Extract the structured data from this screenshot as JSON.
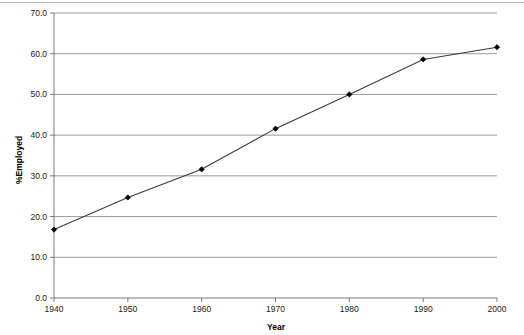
{
  "chart_data": {
    "type": "line",
    "title": "",
    "xlabel": "Year",
    "ylabel": "%Employed",
    "x": [
      1940,
      1950,
      1960,
      1970,
      1980,
      1990,
      2000
    ],
    "values": [
      16.8,
      24.7,
      31.6,
      41.6,
      50.0,
      58.6,
      61.6
    ],
    "series": [
      {
        "name": "%Employed",
        "values": [
          16.8,
          24.7,
          31.6,
          41.6,
          50.0,
          58.6,
          61.6
        ]
      }
    ],
    "xlim": [
      1940,
      2000
    ],
    "ylim": [
      0.0,
      70.0
    ],
    "xticks": [
      "1940",
      "1950",
      "1960",
      "1970",
      "1980",
      "1990",
      "2000"
    ],
    "yticks": [
      "0.0",
      "10.0",
      "20.0",
      "30.0",
      "40.0",
      "50.0",
      "60.0",
      "70.0"
    ],
    "grid": "horizontal",
    "legend": "none",
    "line_color": "#3a3a3a",
    "marker_color": "#000000",
    "gridline_color": "#9a9a9a",
    "axis_color": "#7a7a7a"
  }
}
